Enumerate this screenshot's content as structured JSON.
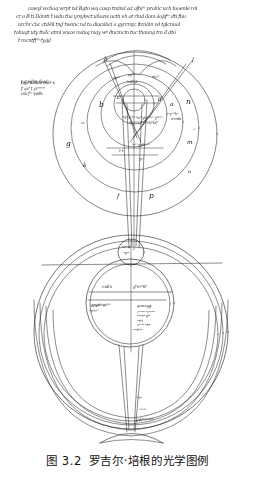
{
  "caption": {
    "number": "图 3.2",
    "title": "罗吉尔·培根的光学图例"
  },
  "manuscript_text": {
    "description": "medieval latin cursive marginalia",
    "top_block": [
      "cowyl wchoq wrpt nd Bgto wq coup tmind ad ofluᵐ prohic uch tooenlé ral",
      "cr a B tí Dảmtí t̀ wdu tha yrsytect uñozw ucth vh ot rhul đom äoþfᵐ dtí fbu",
      "urch́r cbc ctdẽíl tnd̥ twànc nd to diợcábcí a gyrcmḭc ítcnàin wl tglcnuol",
      "tohugt uty thđc atml wuce mduq mąy wᵖ ðncmcin tuc thaung tm đ ḍtō",
      "t̀ mcntff ᵐřyġḍ"
    ],
    "margin_note": [
      "t̥ cᵗ wfcn–fȧcd",
      "ńgḍ t́cbbm ṭcḍt–ṣ",
      "ţᵗ ącᵗ ṭ  yıᵒᵐᵐᵐ",
      "ctà fᵗᵒ ᵒpṣłłı–"
    ]
  },
  "upper_diagram": {
    "name": "concentric-spheres-diagram",
    "circle_letters": [
      {
        "label": "h",
        "x": 104,
        "y": 58
      },
      {
        "label": "l",
        "x": 192,
        "y": 59
      },
      {
        "label": "c",
        "x": 117,
        "y": 96
      },
      {
        "label": "d",
        "x": 158,
        "y": 98
      },
      {
        "label": "b",
        "x": 101,
        "y": 104
      },
      {
        "label": "a",
        "x": 167,
        "y": 103
      },
      {
        "label": "n",
        "x": 183,
        "y": 100
      },
      {
        "label": "g",
        "x": 68,
        "y": 143
      },
      {
        "label": "m",
        "x": 185,
        "y": 142
      },
      {
        "label": "k",
        "x": 84,
        "y": 165
      },
      {
        "label": "o",
        "x": 187,
        "y": 171
      },
      {
        "label": "f",
        "x": 118,
        "y": 196
      },
      {
        "label": "p",
        "x": 150,
        "y": 196
      }
    ],
    "annotations": [
      {
        "text": "spᵒᵐ",
        "x": 116,
        "y": 79
      },
      {
        "text": "dyᵐᵒ",
        "x": 153,
        "y": 78
      },
      {
        "text": "ęyᵐᵐᵐᵐ",
        "x": 131,
        "y": 77
      },
      {
        "text": "tcdcyt–",
        "x": 129,
        "y": 83
      },
      {
        "text": "ᵒᵃtᵒ tᵒ ᵇᵒ ᵒcrᵒyuᵒᵐᶜᵐ yᵒᵐᵐ",
        "x": 125,
        "y": 119
      },
      {
        "text": "ᵗ ᵒcnᵒᵐcf yᵇᵒncᵃbtᵗ",
        "x": 129,
        "y": 124
      },
      {
        "text": "ᵒcᵗ ᵗ yᵒdtᵒ ᵒᵐ",
        "x": 134,
        "y": 146
      },
      {
        "text": "tᵒ tᵗ",
        "x": 121,
        "y": 153
      },
      {
        "text": "ᵒycᵗ",
        "x": 140,
        "y": 160
      },
      {
        "text": "cn",
        "x": 82,
        "y": 124
      },
      {
        "text": "ᵒyᵐᵒᵗhᵒ",
        "x": 170,
        "y": 115
      },
      {
        "text": "ғᵒcnbt",
        "x": 172,
        "y": 120
      },
      {
        "text": "ᵒᶜ",
        "x": 193,
        "y": 131
      }
    ]
  },
  "lower_diagram": {
    "name": "eye-optics-diagram",
    "small_top_circle_text": [
      "тᵒᶜᵒнᵒ",
      "ᵒᵒɡᵒᵐ"
    ],
    "chord_labels": [
      {
        "text": "mdtn",
        "x": 104,
        "y": 288
      },
      {
        "text": "ɡᵇmᶜᵒŧtᵒ",
        "x": 133,
        "y": 288
      }
    ],
    "left_block": [
      "уᵒyᵗғᵗᵒᵒ ɡ ᵇᵗᵇᵒ",
      "ᵇtᵒł ғᵇᵒᵒᵒᵐᶜᵇᵒ",
      "ᵒɡᵒᵒcᵐ"
    ],
    "right_list": [
      "cᵒᵐᵐᶜᵐ ᵗᵒcᵒł",
      "cᵒᵐᵐᵐ ᵗcᵒɡᵒ",
      "cᵒᵐᵐᵐ ᵒᵒcᵐᵐᵒᵐ",
      "ᵒᵇᵒᵐtᵒᵒᵗ ɡᵇᵇ",
      "ᵒᶜtᵇᵒł",
      "cᵒᵒᵐᵐ ᵗᵗ ŧᵇtᵒ",
      "ᵒᵒᶜᵒłłᵒᵐᵐ"
    ],
    "arc_labels": [
      {
        "text": "ᵗᵒᵒcᵇ",
        "x": 136,
        "y": 399
      },
      {
        "text": "ᵒᵒᵐᵒᵇᵗ",
        "x": 139,
        "y": 411
      },
      {
        "text": "ɡŵᵇᶜᵒᵇᵐᶜᵇᵇ",
        "x": 136,
        "y": 421
      }
    ]
  },
  "colors": {
    "ink": "#1a1a1a",
    "paper": "#ffffff",
    "caption_text": "#111111"
  }
}
